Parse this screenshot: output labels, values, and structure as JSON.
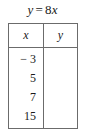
{
  "title": {
    "full": "y = 8x",
    "lhs": "y",
    "operator": "=",
    "coefficient": "8",
    "variable": "x"
  },
  "table": {
    "headers": [
      "x",
      "y"
    ],
    "rows": [
      {
        "x": "− 3",
        "y": ""
      },
      {
        "x": "5",
        "y": ""
      },
      {
        "x": "7",
        "y": ""
      },
      {
        "x": "15",
        "y": ""
      }
    ]
  },
  "colors": {
    "border": "#6b6b6b",
    "text": "#1a1a1a",
    "background": "#ffffff"
  }
}
